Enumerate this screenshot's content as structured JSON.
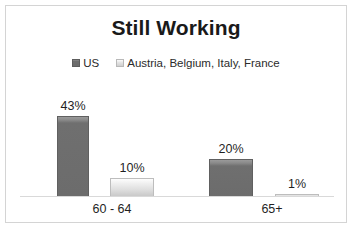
{
  "chart_data": {
    "type": "bar",
    "title": "Still Working",
    "xlabel": "",
    "ylabel": "",
    "ylim": [
      0,
      50
    ],
    "grid": false,
    "legend_position": "top-center",
    "categories": [
      "60 - 64",
      "65+"
    ],
    "series": [
      {
        "name": "US",
        "color": "#6c6c6c",
        "values": [
          43,
          20
        ],
        "labels": [
          "43%",
          "1%"
        ]
      },
      {
        "name": "Austria, Belgium, Italy, France",
        "color": "#dddddd",
        "values": [
          10,
          1
        ],
        "labels": [
          "10%",
          "1%"
        ]
      }
    ],
    "data_labels": {
      "us_60_64": "43%",
      "eu_60_64": "10%",
      "us_65plus": "20%",
      "eu_65plus": "1%"
    }
  },
  "legend": {
    "items": [
      {
        "label": "US",
        "swatch": "legend-swatch-dark"
      },
      {
        "label": "Austria, Belgium, Italy, France",
        "swatch": "legend-swatch-light"
      }
    ]
  },
  "axis": {
    "categories": [
      "60 - 64",
      "65+"
    ]
  },
  "colors": {
    "series_us": "#6c6c6c",
    "series_eu": "#dddddd",
    "frame_border": "#d4d4d4",
    "axis_line": "#d9d9d9",
    "text": "#1f1f1f"
  }
}
